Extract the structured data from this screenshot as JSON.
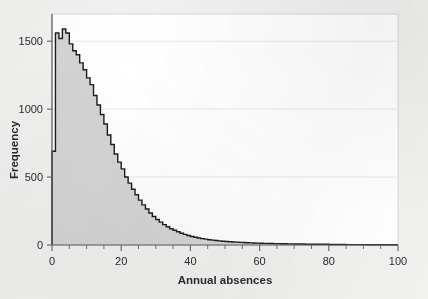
{
  "chart_data": {
    "type": "bar",
    "title": "",
    "subtitle": "",
    "xlabel": "Annual absences",
    "ylabel": "Frequency",
    "xlim": [
      0,
      100
    ],
    "ylim": [
      0,
      1700
    ],
    "grid": true,
    "grid_axis": "y",
    "legend": null,
    "legend_position": "none",
    "bin_width": 1,
    "xticks": [
      0,
      20,
      40,
      60,
      80,
      100
    ],
    "xtick_labels": [
      "0",
      "20",
      "40",
      "60",
      "80",
      "100"
    ],
    "xminor_tick_step": 5,
    "yticks": [
      0,
      500,
      1000,
      1500
    ],
    "ytick_labels": [
      "0",
      "500",
      "1000",
      "1500"
    ],
    "annotations": [],
    "series_name": "Annual absences",
    "fill_color": "#d4d4d4",
    "line_color": "#1c1c1c",
    "plot_background": "#ffffff",
    "figure_background": "#f1f1f0",
    "grid_color": "#e8e8e8",
    "axis_color": "#6f6f6f",
    "categories": [
      0,
      1,
      2,
      3,
      4,
      5,
      6,
      7,
      8,
      9,
      10,
      11,
      12,
      13,
      14,
      15,
      16,
      17,
      18,
      19,
      20,
      21,
      22,
      23,
      24,
      25,
      26,
      27,
      28,
      29,
      30,
      31,
      32,
      33,
      34,
      35,
      36,
      37,
      38,
      39,
      40,
      41,
      42,
      43,
      44,
      45,
      46,
      47,
      48,
      49,
      50,
      51,
      52,
      53,
      54,
      55,
      56,
      57,
      58,
      59,
      60,
      61,
      62,
      63,
      64,
      65,
      66,
      67,
      68,
      69,
      70,
      71,
      72,
      73,
      74,
      75,
      76,
      77,
      78,
      79,
      80,
      81,
      82,
      83,
      84,
      85,
      86,
      87,
      88,
      89,
      90,
      91,
      92,
      93,
      94,
      95,
      96,
      97,
      98,
      99,
      100
    ],
    "values": [
      690,
      1560,
      1520,
      1590,
      1560,
      1480,
      1430,
      1400,
      1340,
      1290,
      1230,
      1180,
      1100,
      1030,
      960,
      890,
      810,
      740,
      670,
      610,
      560,
      500,
      455,
      410,
      370,
      330,
      295,
      265,
      235,
      210,
      188,
      168,
      150,
      134,
      120,
      108,
      97,
      87,
      78,
      70,
      63,
      57,
      52,
      47,
      43,
      39,
      36,
      33,
      30,
      28,
      26,
      24,
      22,
      21,
      19,
      18,
      17,
      16,
      15,
      14,
      13,
      12,
      12,
      11,
      10,
      10,
      9,
      9,
      8,
      8,
      7,
      7,
      7,
      6,
      6,
      6,
      5,
      5,
      5,
      5,
      4,
      4,
      4,
      4,
      4,
      3,
      3,
      3,
      3,
      3,
      3,
      2,
      2,
      2,
      2,
      2,
      2,
      2,
      2,
      2,
      2
    ]
  }
}
